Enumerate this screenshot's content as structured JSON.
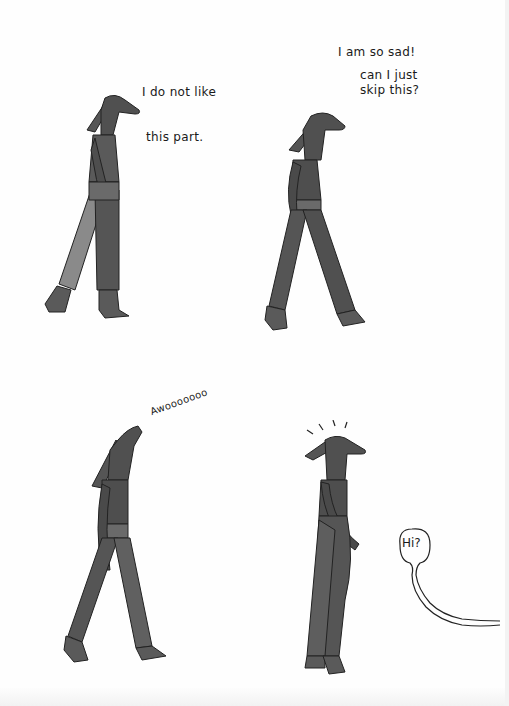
{
  "comic": {
    "panels": [
      {
        "id": 1,
        "caption_lines": [
          "I do not like",
          " this part."
        ],
        "pose": "walking-head-level"
      },
      {
        "id": 2,
        "caption_line_1": "I am so sad!",
        "caption_line_2": "can I just\nskip this?",
        "pose": "walking-head-level"
      },
      {
        "id": 3,
        "caption": "Awooooooo",
        "pose": "walking-head-raised-howling"
      },
      {
        "id": 4,
        "caption": "",
        "pose": "startled-surprise-lines",
        "speech_balloon": {
          "text": "Hi?",
          "source": "offscreen-right"
        }
      }
    ],
    "colors": {
      "paper": "#fefefe",
      "ink": "#1a1a1a",
      "figure_dark": "#4a4a4a",
      "figure_mid": "#6a6a6a",
      "figure_light": "#8e8e8e"
    }
  }
}
